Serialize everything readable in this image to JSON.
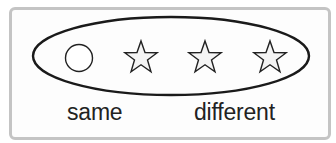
{
  "diagram": {
    "frame": {
      "border_color": "#c4c4c4"
    },
    "group": {
      "shape": "ellipse",
      "stroke_color": "#1a1a1a",
      "members": [
        {
          "shape": "circle",
          "name": "circle"
        },
        {
          "shape": "star",
          "name": "star-1"
        },
        {
          "shape": "star",
          "name": "star-2"
        },
        {
          "shape": "star",
          "name": "star-3"
        }
      ]
    },
    "labels": {
      "same": "same",
      "different": "different"
    }
  }
}
